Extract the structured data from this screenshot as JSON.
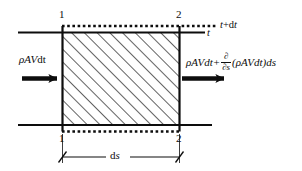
{
  "figure": {
    "type": "control-volume-diagram",
    "background_color": "#ffffff",
    "line_color": "#0d0d0d",
    "hatch_angle_deg": 45,
    "labels": {
      "corner_top_left": "1",
      "corner_top_right": "2",
      "corner_bottom_left": "1",
      "corner_bottom_right": "2",
      "time_upper": "t+dt",
      "time_upper_base": "t",
      "time_upper_sup": "+d",
      "time_upper_tail": "t",
      "time_lower": "t",
      "inlet_flux": "ρAVdt",
      "inlet_flux_rho": "ρ",
      "inlet_flux_AV": "AV",
      "inlet_flux_dt": "dt",
      "outlet_flux_full": "ρAVdt+ ∂/∂s (ρAVdt)ds",
      "outlet_first_term": "ρAVdt+",
      "outlet_frac_num": "∂",
      "outlet_frac_den": "∂s",
      "outlet_second_term": "(ρAVdt)ds",
      "dimension": "ds"
    },
    "arrows": {
      "inlet": "flow-arrow-right",
      "outlet": "flow-arrow-right"
    }
  }
}
